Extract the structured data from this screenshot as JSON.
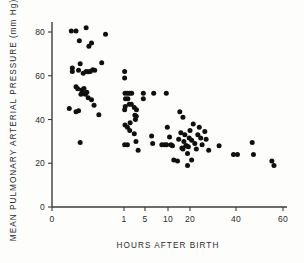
{
  "chart_data": {
    "type": "scatter",
    "title": "",
    "xlabel": "HOURS AFTER BIRTH",
    "ylabel": "MEAN PULMONARY ARTERIAL PRESSURE (mm Hg)",
    "x_scale": "piecewise-log",
    "xlim": [
      0,
      60
    ],
    "ylim": [
      0,
      88
    ],
    "grid": false,
    "legend": "none",
    "x_ticks": [
      0,
      1,
      5,
      10,
      20,
      40,
      60
    ],
    "x_tick_labels": [
      "0",
      "1",
      "5",
      "10",
      "20",
      "40",
      "60"
    ],
    "y_ticks": [
      0,
      20,
      40,
      60,
      80
    ],
    "y_tick_labels": [
      "0",
      "20",
      "40",
      "60",
      "80"
    ],
    "marker": "filled-circle",
    "marker_color": "#101010",
    "marker_size_px": 2.5,
    "n_points": 104,
    "points": [
      [
        0.12,
        80.5
      ],
      [
        0.17,
        80.4
      ],
      [
        0.3,
        82.0
      ],
      [
        0.21,
        76.0
      ],
      [
        0.38,
        75.0
      ],
      [
        0.34,
        73.5
      ],
      [
        0.62,
        79.0
      ],
      [
        0.13,
        63.5
      ],
      [
        0.13,
        62.0
      ],
      [
        0.22,
        65.5
      ],
      [
        0.2,
        62.5
      ],
      [
        0.26,
        61.2
      ],
      [
        0.3,
        62.0
      ],
      [
        0.33,
        61.8
      ],
      [
        0.36,
        62.0
      ],
      [
        0.4,
        62.8
      ],
      [
        0.43,
        62.5
      ],
      [
        0.55,
        66.0
      ],
      [
        0.17,
        55.0
      ],
      [
        0.19,
        54.0
      ],
      [
        0.24,
        53.5
      ],
      [
        0.27,
        54.2
      ],
      [
        0.23,
        51.5
      ],
      [
        0.26,
        52.0
      ],
      [
        0.29,
        51.5
      ],
      [
        0.31,
        52.5
      ],
      [
        0.33,
        50.0
      ],
      [
        0.38,
        49.0
      ],
      [
        0.42,
        46.5
      ],
      [
        0.1,
        45.0
      ],
      [
        0.17,
        43.5
      ],
      [
        0.2,
        44.0
      ],
      [
        0.5,
        42.2
      ],
      [
        0.22,
        29.5
      ],
      [
        1.05,
        62.0
      ],
      [
        1.05,
        59.0
      ],
      [
        1.08,
        52.0
      ],
      [
        1.3,
        52.0
      ],
      [
        1.55,
        52.0
      ],
      [
        1.8,
        52.0
      ],
      [
        1.12,
        49.5
      ],
      [
        1.35,
        49.5
      ],
      [
        1.1,
        46.0
      ],
      [
        1.5,
        47.0
      ],
      [
        1.75,
        47.0
      ],
      [
        1.05,
        44.5
      ],
      [
        2.2,
        45.5
      ],
      [
        2.6,
        44.5
      ],
      [
        1.08,
        37.5
      ],
      [
        1.3,
        36.5
      ],
      [
        1.6,
        38.5
      ],
      [
        1.55,
        35.0
      ],
      [
        2.3,
        42.0
      ],
      [
        2.4,
        40.0
      ],
      [
        2.55,
        41.5
      ],
      [
        2.2,
        33.5
      ],
      [
        1.05,
        28.5
      ],
      [
        1.3,
        28.5
      ],
      [
        2.5,
        30.0
      ],
      [
        2.95,
        26.0
      ],
      [
        4.4,
        52.0
      ],
      [
        4.4,
        49.5
      ],
      [
        6.5,
        52.0
      ],
      [
        9.5,
        52.0
      ],
      [
        6.1,
        32.5
      ],
      [
        6.3,
        29.0
      ],
      [
        8.3,
        28.5
      ],
      [
        9.0,
        28.5
      ],
      [
        9.6,
        28.5
      ],
      [
        9.8,
        36.5
      ],
      [
        10.5,
        32.0
      ],
      [
        11.0,
        28.5
      ],
      [
        11.5,
        28.0
      ],
      [
        12.0,
        21.5
      ],
      [
        13.5,
        21.0
      ],
      [
        14.0,
        31.0
      ],
      [
        15.0,
        34.0
      ],
      [
        15.5,
        27.0
      ],
      [
        16.0,
        26.5
      ],
      [
        16.5,
        30.0
      ],
      [
        17.0,
        33.0
      ],
      [
        17.5,
        28.0
      ],
      [
        18.0,
        28.0
      ],
      [
        18.5,
        24.5
      ],
      [
        19.0,
        27.5
      ],
      [
        19.5,
        31.5
      ],
      [
        20.0,
        35.0
      ],
      [
        20.5,
        30.5
      ],
      [
        20.5,
        21.5
      ],
      [
        21.0,
        38.0
      ],
      [
        21.5,
        29.0
      ],
      [
        22.0,
        26.5
      ],
      [
        22.5,
        33.0
      ],
      [
        23.0,
        36.5
      ],
      [
        23.5,
        31.5
      ],
      [
        24.0,
        28.5
      ],
      [
        25.0,
        34.5
      ],
      [
        25.5,
        31.0
      ],
      [
        26.5,
        26.0
      ],
      [
        14.5,
        43.5
      ],
      [
        16.0,
        41.0
      ],
      [
        18.5,
        19.0
      ],
      [
        31.0,
        28.0
      ],
      [
        38.5,
        24.0
      ],
      [
        40.5,
        24.0
      ],
      [
        46.0,
        29.5
      ],
      [
        46.5,
        24.0
      ],
      [
        54.5,
        21.0
      ],
      [
        55.5,
        19.0
      ]
    ]
  },
  "axes": {
    "x_title": "HOURS AFTER BIRTH",
    "y_title": "MEAN PULMONARY ARTERIAL PRESSURE (mm Hg)"
  }
}
